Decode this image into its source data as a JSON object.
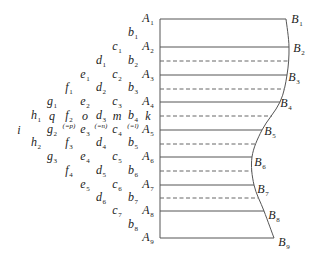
{
  "diagram": {
    "left_wall": {
      "x": 160,
      "top_y": 19,
      "bottom_y": 238
    },
    "solid_rows": [
      {
        "y": 19,
        "x_end": 286
      },
      {
        "y": 47,
        "x_end": 289
      },
      {
        "y": 75,
        "x_end": 287
      },
      {
        "y": 102,
        "x_end": 280
      },
      {
        "y": 130,
        "x_end": 262
      },
      {
        "y": 157,
        "x_end": 252
      },
      {
        "y": 185,
        "x_end": 254
      },
      {
        "y": 211,
        "x_end": 264
      },
      {
        "y": 238,
        "x_end": 274
      }
    ],
    "dashed_rows": [
      {
        "y": 61,
        "x_end": 288
      },
      {
        "y": 89,
        "x_end": 284
      },
      {
        "y": 116,
        "x_end": 272
      },
      {
        "y": 144,
        "x_end": 256
      },
      {
        "y": 171,
        "x_end": 252
      },
      {
        "y": 198,
        "x_end": 258
      }
    ],
    "contour_points": [
      [
        286,
        19
      ],
      [
        289,
        47
      ],
      [
        287,
        75
      ],
      [
        280,
        102
      ],
      [
        262,
        130
      ],
      [
        252,
        157
      ],
      [
        254,
        185
      ],
      [
        264,
        211
      ],
      [
        274,
        238
      ]
    ],
    "node_labels": [
      {
        "base": "A",
        "sub": "1",
        "x": 148,
        "y": 19
      },
      {
        "base": "b",
        "sub": "1",
        "x": 133,
        "y": 33
      },
      {
        "base": "c",
        "sub": "1",
        "x": 117,
        "y": 47
      },
      {
        "base": "A",
        "sub": "2",
        "x": 148,
        "y": 47
      },
      {
        "base": "d",
        "sub": "1",
        "x": 101,
        "y": 61
      },
      {
        "base": "b",
        "sub": "2",
        "x": 133,
        "y": 61
      },
      {
        "base": "e",
        "sub": "1",
        "x": 85,
        "y": 75
      },
      {
        "base": "c",
        "sub": "2",
        "x": 117,
        "y": 75
      },
      {
        "base": "A",
        "sub": "3",
        "x": 148,
        "y": 75
      },
      {
        "base": "f",
        "sub": "1",
        "x": 69,
        "y": 88
      },
      {
        "base": "d",
        "sub": "2",
        "x": 101,
        "y": 88
      },
      {
        "base": "b",
        "sub": "3",
        "x": 133,
        "y": 88
      },
      {
        "base": "g",
        "sub": "1",
        "x": 52,
        "y": 102
      },
      {
        "base": "e",
        "sub": "2",
        "x": 85,
        "y": 102
      },
      {
        "base": "c",
        "sub": "3",
        "x": 117,
        "y": 102
      },
      {
        "base": "A",
        "sub": "4",
        "x": 148,
        "y": 102
      },
      {
        "base": "h",
        "sub": "1",
        "x": 36,
        "y": 116
      },
      {
        "base": "q",
        "sub": "",
        "x": 52,
        "y": 116
      },
      {
        "base": "f",
        "sub": "2",
        "x": 69,
        "y": 116
      },
      {
        "base": "o",
        "sub": "",
        "x": 85,
        "y": 116
      },
      {
        "base": "d",
        "sub": "3",
        "x": 101,
        "y": 116
      },
      {
        "base": "m",
        "sub": "",
        "x": 117,
        "y": 116
      },
      {
        "base": "b",
        "sub": "4",
        "x": 133,
        "y": 116
      },
      {
        "base": "k",
        "sub": "",
        "x": 148,
        "y": 116
      },
      {
        "base": "i",
        "sub": "",
        "x": 19,
        "y": 130
      },
      {
        "base": "g",
        "sub": "2",
        "x": 52,
        "y": 130
      },
      {
        "base": "e",
        "sub": "3",
        "x": 85,
        "y": 130
      },
      {
        "base": "c",
        "sub": "4",
        "x": 117,
        "y": 130
      },
      {
        "base": "A",
        "sub": "5",
        "x": 148,
        "y": 130
      },
      {
        "base": "h",
        "sub": "2",
        "x": 36,
        "y": 143
      },
      {
        "base": "f",
        "sub": "3",
        "x": 69,
        "y": 143
      },
      {
        "base": "d",
        "sub": "4",
        "x": 101,
        "y": 143
      },
      {
        "base": "b",
        "sub": "5",
        "x": 133,
        "y": 143
      },
      {
        "base": "g",
        "sub": "3",
        "x": 52,
        "y": 157
      },
      {
        "base": "e",
        "sub": "4",
        "x": 85,
        "y": 157
      },
      {
        "base": "c",
        "sub": "5",
        "x": 117,
        "y": 157
      },
      {
        "base": "A",
        "sub": "6",
        "x": 148,
        "y": 157
      },
      {
        "base": "f",
        "sub": "4",
        "x": 69,
        "y": 171
      },
      {
        "base": "d",
        "sub": "5",
        "x": 101,
        "y": 171
      },
      {
        "base": "b",
        "sub": "6",
        "x": 133,
        "y": 171
      },
      {
        "base": "e",
        "sub": "5",
        "x": 85,
        "y": 185
      },
      {
        "base": "c",
        "sub": "6",
        "x": 117,
        "y": 185
      },
      {
        "base": "A",
        "sub": "7",
        "x": 148,
        "y": 185
      },
      {
        "base": "d",
        "sub": "6",
        "x": 101,
        "y": 198
      },
      {
        "base": "b",
        "sub": "7",
        "x": 133,
        "y": 198
      },
      {
        "base": "c",
        "sub": "7",
        "x": 117,
        "y": 211
      },
      {
        "base": "A",
        "sub": "8",
        "x": 148,
        "y": 211
      },
      {
        "base": "b",
        "sub": "8",
        "x": 133,
        "y": 225
      },
      {
        "base": "A",
        "sub": "9",
        "x": 148,
        "y": 238
      }
    ],
    "equivalence_notes": [
      {
        "text": "(=p)",
        "x": 69,
        "y": 126
      },
      {
        "text": "(=n)",
        "x": 101,
        "y": 126
      },
      {
        "text": "(=l)",
        "x": 133,
        "y": 126
      }
    ],
    "contour_labels": [
      {
        "base": "B",
        "sub": "1",
        "x": 297,
        "y": 20
      },
      {
        "base": "B",
        "sub": "2",
        "x": 299,
        "y": 49
      },
      {
        "base": "B",
        "sub": "3",
        "x": 294,
        "y": 78
      },
      {
        "base": "B",
        "sub": "4",
        "x": 286,
        "y": 104
      },
      {
        "base": "B",
        "sub": "5",
        "x": 270,
        "y": 132
      },
      {
        "base": "B",
        "sub": "6",
        "x": 260,
        "y": 163
      },
      {
        "base": "B",
        "sub": "7",
        "x": 263,
        "y": 190
      },
      {
        "base": "B",
        "sub": "8",
        "x": 274,
        "y": 216
      },
      {
        "base": "B",
        "sub": "9",
        "x": 284,
        "y": 243
      }
    ]
  }
}
